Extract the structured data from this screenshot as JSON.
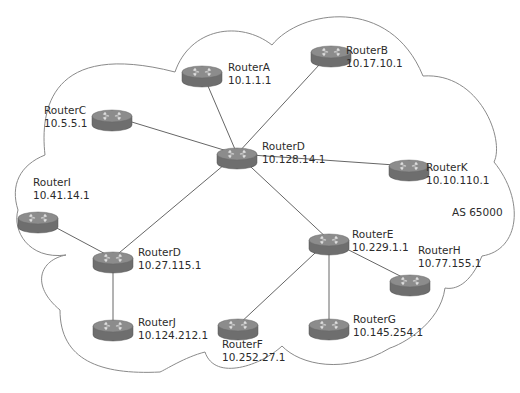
{
  "diagram": {
    "as_label": "AS 65000",
    "colors": {
      "cloud_stroke": "#8a8a8a",
      "link": "#555555",
      "router_side": "#6e6e6e",
      "router_top": "#8c8c8c"
    },
    "routers": [
      {
        "id": "A",
        "name": "RouterA",
        "ip": "10.1.1.1",
        "x": 202,
        "y": 72
      },
      {
        "id": "B",
        "name": "RouterB",
        "ip": "10.17.10.1",
        "x": 331,
        "y": 52
      },
      {
        "id": "C",
        "name": "RouterC",
        "ip": "10.5.5.1",
        "x": 112,
        "y": 116
      },
      {
        "id": "D1",
        "name": "RouterD",
        "ip": "10.128.14.1",
        "x": 237,
        "y": 154
      },
      {
        "id": "K",
        "name": "RouterK",
        "ip": "10.10.110.1",
        "x": 409,
        "y": 166
      },
      {
        "id": "I",
        "name": "RouterI",
        "ip": "10.41.14.1",
        "x": 38,
        "y": 218
      },
      {
        "id": "D2",
        "name": "RouterD",
        "ip": "10.27.115.1",
        "x": 113,
        "y": 258
      },
      {
        "id": "J",
        "name": "RouterJ",
        "ip": "10.124.212.1",
        "x": 113,
        "y": 326
      },
      {
        "id": "E",
        "name": "RouterE",
        "ip": "10.229.1.1",
        "x": 329,
        "y": 240
      },
      {
        "id": "H",
        "name": "RouterH",
        "ip": "10.77.155.1",
        "x": 410,
        "y": 281
      },
      {
        "id": "G",
        "name": "RouterG",
        "ip": "10.145.254.1",
        "x": 329,
        "y": 325
      },
      {
        "id": "F",
        "name": "RouterF",
        "ip": "10.252.27.1",
        "x": 238,
        "y": 325
      }
    ],
    "links": [
      [
        "D1",
        "A"
      ],
      [
        "D1",
        "B"
      ],
      [
        "D1",
        "C"
      ],
      [
        "D1",
        "K"
      ],
      [
        "D1",
        "D2"
      ],
      [
        "D1",
        "E"
      ],
      [
        "D2",
        "I"
      ],
      [
        "D2",
        "J"
      ],
      [
        "E",
        "H"
      ],
      [
        "E",
        "G"
      ],
      [
        "E",
        "F"
      ]
    ]
  }
}
